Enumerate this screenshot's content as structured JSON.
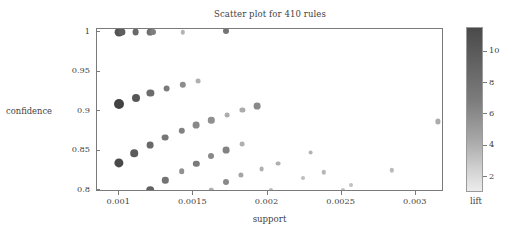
{
  "chart_data": {
    "type": "scatter",
    "title": "Scatter plot for 410 rules",
    "xlabel": "support",
    "ylabel": "confidence",
    "xlim": [
      0.00085,
      0.00319
    ],
    "ylim": [
      0.7975,
      1.004
    ],
    "grid": false,
    "xticks": [
      0.001,
      0.0015,
      0.002,
      0.0025,
      0.003
    ],
    "xtick_labels": [
      "0.001",
      "0.0015",
      "0.002",
      "0.0025",
      "0.003"
    ],
    "yticks": [
      0.8,
      0.85,
      0.9,
      0.95,
      1
    ],
    "ytick_labels": [
      "0.8",
      "0.85",
      "0.9",
      "0.95",
      "1"
    ],
    "colorbar": {
      "label": "lift",
      "ticks": [
        2,
        4,
        6,
        8,
        10
      ],
      "tick_labels": [
        "2",
        "4",
        "6",
        "8",
        "10"
      ],
      "vmin": 1.0,
      "vmax": 11.5,
      "colormap": "grays-reversed",
      "high_color": "#4a4a4a",
      "low_color": "#ececec"
    },
    "point_count": 410,
    "points": [
      {
        "support": 0.001,
        "confidence": 1.0,
        "lift": 9.6,
        "size": 4.4
      },
      {
        "support": 0.00102,
        "confidence": 1.0,
        "lift": 9.0,
        "size": 3.6
      },
      {
        "support": 0.00111,
        "confidence": 1.0,
        "lift": 8.4,
        "size": 3.4
      },
      {
        "support": 0.00121,
        "confidence": 1.0,
        "lift": 8.0,
        "size": 3.4
      },
      {
        "support": 0.00123,
        "confidence": 1.0,
        "lift": 7.2,
        "size": 3.0
      },
      {
        "support": 0.00143,
        "confidence": 1.0,
        "lift": 4.2,
        "size": 2.2
      },
      {
        "support": 0.00172,
        "confidence": 1.001,
        "lift": 7.8,
        "size": 3.0
      },
      {
        "support": 0.001,
        "confidence": 0.9085,
        "lift": 10.6,
        "size": 5.0
      },
      {
        "support": 0.00111,
        "confidence": 0.9165,
        "lift": 9.4,
        "size": 4.0
      },
      {
        "support": 0.00121,
        "confidence": 0.9235,
        "lift": 8.2,
        "size": 3.6
      },
      {
        "support": 0.00132,
        "confidence": 0.9285,
        "lift": 7.4,
        "size": 3.4
      },
      {
        "support": 0.00143,
        "confidence": 0.933,
        "lift": 6.4,
        "size": 3.2
      },
      {
        "support": 0.00153,
        "confidence": 0.938,
        "lift": 4.4,
        "size": 2.4
      },
      {
        "support": 0.001,
        "confidence": 0.834,
        "lift": 10.2,
        "size": 4.6
      },
      {
        "support": 0.0011,
        "confidence": 0.8465,
        "lift": 9.2,
        "size": 3.8
      },
      {
        "support": 0.00121,
        "confidence": 0.8565,
        "lift": 8.4,
        "size": 3.4
      },
      {
        "support": 0.00131,
        "confidence": 0.8665,
        "lift": 7.6,
        "size": 3.4
      },
      {
        "support": 0.00142,
        "confidence": 0.875,
        "lift": 7.0,
        "size": 3.2
      },
      {
        "support": 0.00152,
        "confidence": 0.8825,
        "lift": 6.6,
        "size": 3.4
      },
      {
        "support": 0.00162,
        "confidence": 0.8885,
        "lift": 6.2,
        "size": 3.2
      },
      {
        "support": 0.00173,
        "confidence": 0.895,
        "lift": 4.6,
        "size": 2.4
      },
      {
        "support": 0.00183,
        "confidence": 0.901,
        "lift": 4.6,
        "size": 2.6
      },
      {
        "support": 0.00193,
        "confidence": 0.906,
        "lift": 6.6,
        "size": 3.4
      },
      {
        "support": 0.00121,
        "confidence": 0.8,
        "lift": 8.8,
        "size": 3.8
      },
      {
        "support": 0.00131,
        "confidence": 0.8125,
        "lift": 7.8,
        "size": 3.2
      },
      {
        "support": 0.00142,
        "confidence": 0.8235,
        "lift": 6.2,
        "size": 2.8
      },
      {
        "support": 0.00152,
        "confidence": 0.8335,
        "lift": 7.4,
        "size": 3.2
      },
      {
        "support": 0.00162,
        "confidence": 0.843,
        "lift": 6.6,
        "size": 3.0
      },
      {
        "support": 0.00172,
        "confidence": 0.8505,
        "lift": 7.0,
        "size": 3.4
      },
      {
        "support": 0.00183,
        "confidence": 0.858,
        "lift": 4.4,
        "size": 2.4
      },
      {
        "support": 0.00162,
        "confidence": 0.8,
        "lift": 4.4,
        "size": 2.2
      },
      {
        "support": 0.00172,
        "confidence": 0.8105,
        "lift": 6.6,
        "size": 3.0
      },
      {
        "support": 0.00182,
        "confidence": 0.819,
        "lift": 5.0,
        "size": 2.6
      },
      {
        "support": 0.00196,
        "confidence": 0.827,
        "lift": 4.4,
        "size": 2.4
      },
      {
        "support": 0.00202,
        "confidence": 0.8,
        "lift": 3.8,
        "size": 2.0
      },
      {
        "support": 0.00207,
        "confidence": 0.8335,
        "lift": 4.4,
        "size": 2.4
      },
      {
        "support": 0.00224,
        "confidence": 0.815,
        "lift": 3.6,
        "size": 2.0
      },
      {
        "support": 0.00229,
        "confidence": 0.8475,
        "lift": 4.2,
        "size": 2.4
      },
      {
        "support": 0.00238,
        "confidence": 0.8225,
        "lift": 4.0,
        "size": 2.2
      },
      {
        "support": 0.00251,
        "confidence": 0.8,
        "lift": 3.4,
        "size": 2.0
      },
      {
        "support": 0.00256,
        "confidence": 0.8065,
        "lift": 3.4,
        "size": 2.0
      },
      {
        "support": 0.00284,
        "confidence": 0.825,
        "lift": 3.8,
        "size": 2.2
      },
      {
        "support": 0.00315,
        "confidence": 0.887,
        "lift": 4.6,
        "size": 2.6
      }
    ]
  }
}
